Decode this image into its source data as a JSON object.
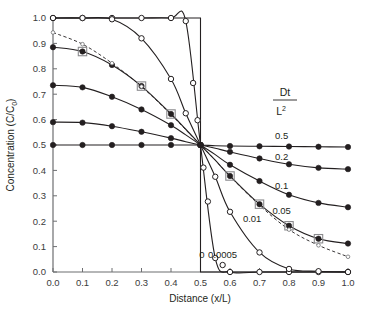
{
  "chart_data": {
    "type": "line",
    "title": "",
    "xlabel": "Distance (x/L)",
    "ylabel": "Concentration (C/C0)",
    "ylabel_main": "Concentration (C/C",
    "ylabel_sub": "0",
    "ylabel_tail": ")",
    "xlim": [
      0.0,
      1.0
    ],
    "ylim": [
      0.0,
      1.0
    ],
    "grid": false,
    "legend_position": "inline-right",
    "legend_title_numerator": "Dt",
    "legend_title_denominator": "L",
    "legend_title_denominator_exponent": "2",
    "xticks": [
      "0.0",
      "0.1",
      "0.2",
      "0.3",
      "0.4",
      "0.5",
      "0.6",
      "0.7",
      "0.8",
      "0.9",
      "1.0"
    ],
    "xtick_values": [
      0.0,
      0.1,
      0.2,
      0.3,
      0.4,
      0.5,
      0.6,
      0.7,
      0.8,
      0.9,
      1.0
    ],
    "yticks": [
      "0.0",
      "0.1",
      "0.2",
      "0.3",
      "0.4",
      "0.5",
      "0.6",
      "0.7",
      "0.8",
      "0.9",
      "1.0"
    ],
    "ytick_values": [
      0.0,
      0.1,
      0.2,
      0.3,
      0.4,
      0.5,
      0.6,
      0.7,
      0.8,
      0.9,
      1.0
    ],
    "x": [
      0.0,
      0.1,
      0.2,
      0.3,
      0.4,
      0.45,
      0.5,
      0.55,
      0.6,
      0.7,
      0.8,
      0.9,
      1.0
    ],
    "series": [
      {
        "name": "0",
        "label": "0",
        "marker": "none",
        "line": "solid",
        "label_x": 0.505,
        "label_y": 0.055,
        "values": [
          1.0,
          1.0,
          1.0,
          1.0,
          1.0,
          1.0,
          1.0,
          0.0,
          0.0,
          0.0,
          0.0,
          0.0,
          0.0
        ],
        "note": "step function: C=1 for x<0.5, C=0 for x>0.5"
      },
      {
        "name": "0.0005",
        "label": "0.0005",
        "marker": "open-circle",
        "line": "solid",
        "label_x": 0.575,
        "label_y": 0.055,
        "values": [
          1.0,
          1.0,
          1.0,
          1.0,
          1.0,
          0.988,
          0.5,
          0.055,
          0.0,
          0.0,
          0.0,
          0.0,
          0.0
        ]
      },
      {
        "name": "0.01",
        "label": "0.01",
        "marker": "open-circle",
        "line": "solid",
        "label_x": 0.675,
        "label_y": 0.195,
        "values": [
          1.0,
          1.0,
          0.995,
          0.92,
          0.76,
          0.625,
          0.5,
          0.375,
          0.237,
          0.077,
          0.012,
          0.003,
          0.0
        ]
      },
      {
        "name": "0.05",
        "label": "0.05",
        "marker": "open-square-filled-circle",
        "line": "solid",
        "label_x": 0.775,
        "label_y": 0.228,
        "values": [
          0.885,
          0.868,
          0.815,
          0.732,
          0.622,
          0.562,
          0.5,
          0.44,
          0.378,
          0.267,
          0.182,
          0.131,
          0.112
        ]
      },
      {
        "name": "0.05-analytic",
        "label": "",
        "marker": "tiny-open-circle",
        "line": "dashed",
        "label_x": null,
        "label_y": null,
        "values": [
          0.943,
          0.897,
          0.822,
          0.73,
          0.62,
          0.56,
          0.5,
          0.44,
          0.377,
          0.263,
          0.167,
          0.105,
          0.06
        ]
      },
      {
        "name": "0.1",
        "label": "0.1",
        "marker": "filled-circle",
        "line": "solid",
        "label_x": 0.775,
        "label_y": 0.325,
        "values": [
          0.735,
          0.727,
          0.69,
          0.64,
          0.578,
          0.54,
          0.5,
          0.462,
          0.422,
          0.358,
          0.304,
          0.272,
          0.255
        ]
      },
      {
        "name": "0.2",
        "label": "0.2",
        "marker": "filled-circle",
        "line": "solid",
        "label_x": 0.775,
        "label_y": 0.442,
        "values": [
          0.59,
          0.588,
          0.574,
          0.552,
          0.527,
          0.513,
          0.5,
          0.487,
          0.473,
          0.447,
          0.424,
          0.41,
          0.405
        ]
      },
      {
        "name": "0.5",
        "label": "0.5",
        "marker": "filled-circle",
        "line": "solid",
        "label_x": 0.775,
        "label_y": 0.525,
        "values": [
          0.5,
          0.5,
          0.5,
          0.5,
          0.5,
          0.5,
          0.5,
          0.497,
          0.496,
          0.495,
          0.494,
          0.493,
          0.492
        ]
      }
    ],
    "marker_x_values": {
      "0.0005": [
        0.0,
        0.1,
        0.2,
        0.3,
        0.4,
        0.45,
        0.475,
        0.49,
        0.5,
        0.51,
        0.525,
        0.55,
        0.575,
        0.6,
        0.7,
        0.8,
        0.9,
        1.0
      ],
      "0.01": [
        0.0,
        0.1,
        0.2,
        0.3,
        0.4,
        0.45,
        0.5,
        0.55,
        0.6,
        0.7,
        0.8,
        0.9,
        1.0
      ],
      "0.05": [
        0.0,
        0.1,
        0.2,
        0.3,
        0.4,
        0.5,
        0.6,
        0.7,
        0.8,
        0.9,
        1.0
      ],
      "0.1": [
        0.0,
        0.1,
        0.2,
        0.3,
        0.4,
        0.5,
        0.6,
        0.7,
        0.8,
        0.9,
        1.0
      ],
      "0.2": [
        0.0,
        0.1,
        0.2,
        0.3,
        0.4,
        0.5,
        0.6,
        0.7,
        0.8,
        0.9,
        1.0
      ],
      "0.5": [
        0.0,
        0.1,
        0.2,
        0.3,
        0.4,
        0.5,
        0.6,
        0.7,
        0.8,
        0.9,
        1.0
      ]
    },
    "square_marker_x": {
      "0.05": [
        0.1,
        0.3,
        0.4,
        0.6,
        0.7,
        0.8,
        0.9
      ]
    },
    "colors": {
      "line": "#231f20",
      "axis": "#6d6e71",
      "text": "#231f20",
      "background": "#ffffff"
    }
  }
}
